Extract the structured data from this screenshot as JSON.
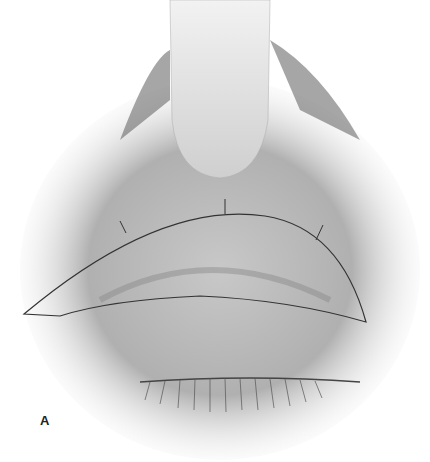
{
  "figure": {
    "panel_label": "A",
    "colors": {
      "background": "#ffffff",
      "shading": "#9a9a9a",
      "line": "#333333"
    }
  }
}
